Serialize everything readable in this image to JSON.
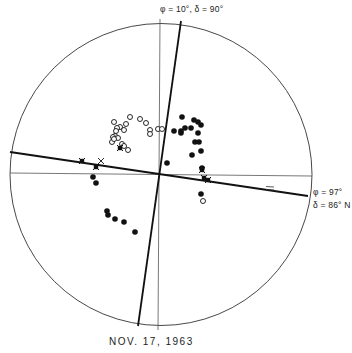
{
  "figure": {
    "caption_date": "NOV.  17,  1963",
    "labels": {
      "top_axis": "φ = 10°,  δ = 90°",
      "right_axis_phi": "φ = 97°",
      "right_axis_delta": "δ = 86° N"
    },
    "colors": {
      "ink": "#111111",
      "thin_line": "#444444",
      "background": "#ffffff"
    }
  },
  "chart_data": {
    "type": "scatter",
    "title": "",
    "subtitle": "NOV. 17, 1963",
    "frame": {
      "shape": "circle",
      "center_px": [
        161,
        174
      ],
      "radius_px": 151
    },
    "reference_lines": [
      {
        "name": "vertical-axis",
        "style": "thin",
        "from": [
          160,
          19
        ],
        "to": [
          158,
          330
        ]
      },
      {
        "name": "horizontal-axis",
        "style": "thin",
        "from": [
          10,
          173
        ],
        "to": [
          312,
          176
        ]
      },
      {
        "name": "great-circle-phi-10",
        "style": "thick",
        "label": "φ = 10°, δ = 90°",
        "from": [
          181,
          21
        ],
        "to": [
          138,
          326
        ]
      },
      {
        "name": "great-circle-phi-97",
        "style": "thick",
        "label": "φ = 97°, δ = 86° N",
        "from": [
          10,
          152
        ],
        "to": [
          308,
          196
        ]
      }
    ],
    "series": [
      {
        "name": "open-circles",
        "marker": "open-circle",
        "points_px": [
          [
            130,
            117
          ],
          [
            140,
            119
          ],
          [
            146,
            123
          ],
          [
            126,
            124
          ],
          [
            114,
            122
          ],
          [
            120,
            127
          ],
          [
            117,
            128
          ],
          [
            116,
            131
          ],
          [
            124,
            130
          ],
          [
            115,
            136
          ],
          [
            113,
            137
          ],
          [
            112,
            142
          ],
          [
            118,
            138
          ],
          [
            122,
            144
          ],
          [
            124,
            146
          ],
          [
            128,
            150
          ],
          [
            150,
            130
          ],
          [
            150,
            134
          ],
          [
            158,
            129
          ],
          [
            162,
            129
          ],
          [
            114,
            139
          ],
          [
            203,
            201
          ]
        ]
      },
      {
        "name": "filled-circles",
        "marker": "filled-circle",
        "points_px": [
          [
            182,
            117
          ],
          [
            194,
            120
          ],
          [
            198,
            122
          ],
          [
            201,
            125
          ],
          [
            174,
            131
          ],
          [
            181,
            131
          ],
          [
            185,
            128
          ],
          [
            191,
            128
          ],
          [
            181,
            133
          ],
          [
            198,
            133
          ],
          [
            195,
            142
          ],
          [
            199,
            142
          ],
          [
            192,
            155
          ],
          [
            201,
            151
          ],
          [
            167,
            163
          ],
          [
            202,
            168
          ],
          [
            201,
            194
          ],
          [
            93,
            177
          ],
          [
            96,
            183
          ],
          [
            107,
            211
          ],
          [
            108,
            215
          ],
          [
            115,
            219
          ],
          [
            124,
            222
          ],
          [
            135,
            232
          ]
        ]
      },
      {
        "name": "crossed-markers",
        "marker": "x-filled",
        "points_px": [
          [
            82,
            161
          ],
          [
            96,
            167
          ],
          [
            202,
            170
          ],
          [
            204,
            178
          ],
          [
            208,
            180
          ],
          [
            120,
            148
          ]
        ]
      },
      {
        "name": "open-crosses",
        "marker": "x",
        "points_px": [
          [
            101,
            161
          ]
        ]
      }
    ],
    "annotations": [
      {
        "text": "=",
        "position_px": [
          270,
          188
        ]
      }
    ],
    "grid": false,
    "legend": null
  }
}
